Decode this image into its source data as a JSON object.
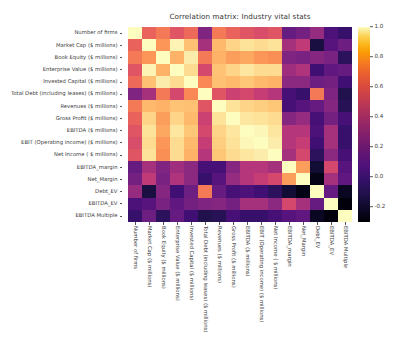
{
  "chart_data": {
    "type": "heatmap",
    "title": "Correlation matrix: Industry vital stats",
    "xlabel": "",
    "ylabel": "",
    "colormap": "magma",
    "grid": false,
    "legend_position": "right",
    "colorbar": {
      "vmin": -0.3,
      "vmax": 1.0,
      "ticks": [
        1.0,
        0.8,
        0.6,
        0.4,
        0.2,
        0.0,
        -0.2
      ],
      "tick_labels": [
        "1.0",
        "0.8",
        "0.6",
        "0.4",
        "0.2",
        "0.0",
        "-0.2"
      ]
    },
    "categories": [
      "Number of firms",
      "Market Cap ($ millions)",
      "Book Equity ($ millions)",
      "Enterprise Value ($ millions)",
      "Invested Capital ($ millions)",
      "Total Debt (including leases) ($ millions)",
      "Revenues ($ millions)",
      "Gross Profit ($ millions)",
      "EBITDA ($ millions)",
      "EBIT (Operating income) ($ millions)",
      "Net Income ( $ millions)",
      "EBITDA_margin",
      "Net_Margin",
      "Debt_EV",
      "EBITDA_EV",
      "EBITDA Multiple"
    ],
    "x_tick_labels": [
      "Number of firms",
      "Market Cap ($ millions)",
      "Book Equity ($ millions)",
      "Enterprise Value ($ millions)",
      "Invested Capital ($ millions)",
      "Total Debt (including leases) ($ millions)",
      "Revenues ($ millions)",
      "Gross Profit ($ millions)",
      "EBITDA ($ millions)",
      "EBIT (Operating income) ($ millions)",
      "Net Income ( $ millions)",
      "EBITDA_margin",
      "Net_Margin",
      "Debt_EV",
      "EBITDA_EV",
      "EBITDA Multiple"
    ],
    "y_tick_labels": [
      "Number of firms",
      "Market Cap ($ millions)",
      "Book Equity ($ millions)",
      "Enterprise Value ($ millions)",
      "Invested Capital ($ millions)",
      "Total Debt (including leases) ($ millions)",
      "Revenues ($ millions)",
      "Gross Profit ($ millions)",
      "EBITDA ($ millions)",
      "EBIT (Operating income) ($ millions)",
      "Net Income ( $ millions)",
      "EBITDA_margin",
      "Net_Margin",
      "Debt_EV",
      "EBITDA_EV",
      "EBITDA Multiple"
    ],
    "values": [
      [
        1.0,
        0.55,
        0.62,
        0.5,
        0.57,
        0.18,
        0.62,
        0.55,
        0.5,
        0.47,
        0.5,
        0.1,
        0.14,
        0.25,
        0.02,
        -0.05
      ],
      [
        0.55,
        1.0,
        0.7,
        0.97,
        0.82,
        0.3,
        0.8,
        0.88,
        0.92,
        0.9,
        0.92,
        0.3,
        0.38,
        -0.15,
        0.05,
        0.12
      ],
      [
        0.62,
        0.7,
        1.0,
        0.78,
        0.95,
        0.62,
        0.78,
        0.72,
        0.75,
        0.7,
        0.68,
        0.18,
        0.16,
        0.2,
        0.16,
        -0.08
      ],
      [
        0.5,
        0.97,
        0.78,
        1.0,
        0.9,
        0.45,
        0.83,
        0.88,
        0.93,
        0.9,
        0.9,
        0.28,
        0.33,
        -0.02,
        0.08,
        0.1
      ],
      [
        0.57,
        0.82,
        0.95,
        0.9,
        1.0,
        0.66,
        0.82,
        0.8,
        0.84,
        0.8,
        0.78,
        0.22,
        0.22,
        0.12,
        0.14,
        -0.02
      ],
      [
        0.18,
        0.3,
        0.62,
        0.45,
        0.66,
        1.0,
        0.5,
        0.42,
        0.45,
        0.4,
        0.35,
        0.0,
        -0.05,
        0.62,
        0.18,
        -0.12
      ],
      [
        0.62,
        0.8,
        0.78,
        0.83,
        0.82,
        0.5,
        1.0,
        0.92,
        0.88,
        0.86,
        0.84,
        0.0,
        0.05,
        0.1,
        0.2,
        -0.1
      ],
      [
        0.55,
        0.88,
        0.72,
        0.88,
        0.8,
        0.42,
        0.92,
        1.0,
        0.93,
        0.92,
        0.9,
        0.2,
        0.25,
        0.0,
        0.14,
        0.0
      ],
      [
        0.5,
        0.92,
        0.75,
        0.93,
        0.84,
        0.45,
        0.88,
        0.93,
        1.0,
        0.98,
        0.93,
        0.35,
        0.35,
        0.02,
        0.3,
        -0.05
      ],
      [
        0.47,
        0.9,
        0.7,
        0.9,
        0.8,
        0.4,
        0.86,
        0.92,
        0.98,
        1.0,
        0.95,
        0.35,
        0.4,
        -0.02,
        0.3,
        -0.05
      ],
      [
        0.5,
        0.92,
        0.68,
        0.9,
        0.78,
        0.35,
        0.84,
        0.9,
        0.93,
        0.95,
        1.0,
        0.3,
        0.45,
        -0.08,
        0.22,
        0.0
      ],
      [
        0.1,
        0.3,
        0.18,
        0.28,
        0.22,
        0.0,
        0.0,
        0.2,
        0.35,
        0.35,
        0.3,
        1.0,
        0.72,
        -0.18,
        0.45,
        0.05
      ],
      [
        0.14,
        0.38,
        0.16,
        0.33,
        0.22,
        -0.05,
        0.05,
        0.25,
        0.35,
        0.4,
        0.45,
        0.72,
        1.0,
        -0.25,
        0.3,
        0.08
      ],
      [
        0.25,
        -0.15,
        0.2,
        -0.02,
        0.12,
        0.62,
        0.1,
        0.0,
        0.02,
        -0.02,
        -0.08,
        -0.18,
        -0.25,
        1.0,
        0.1,
        -0.22
      ],
      [
        0.02,
        0.05,
        0.16,
        0.08,
        0.14,
        0.18,
        0.2,
        0.14,
        0.3,
        0.3,
        0.22,
        0.45,
        0.3,
        0.1,
        1.0,
        -0.28
      ],
      [
        -0.05,
        0.12,
        -0.08,
        0.1,
        -0.02,
        -0.12,
        -0.1,
        0.0,
        -0.05,
        -0.05,
        0.0,
        0.05,
        0.08,
        -0.22,
        -0.28,
        1.0
      ]
    ]
  }
}
